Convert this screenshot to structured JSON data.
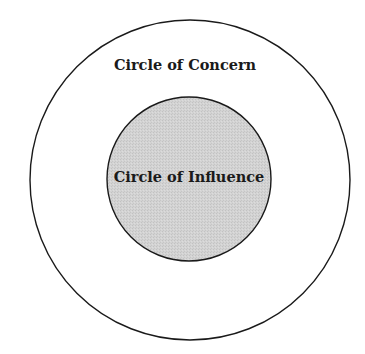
{
  "diagram": {
    "outer_circle": {
      "label": "Circle of Concern",
      "fill": "#ffffff",
      "stroke": "#1a1a1a"
    },
    "inner_circle": {
      "label": "Circle of Influence",
      "fill": "#d2d2d2",
      "stroke": "#1a1a1a"
    }
  }
}
